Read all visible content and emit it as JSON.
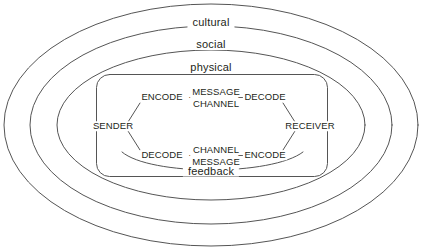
{
  "diagram": {
    "colors": {
      "stroke": "#555555",
      "text": "#231f20",
      "background": "#ffffff"
    },
    "environments": [
      {
        "name": "cultural",
        "label": "cultural"
      },
      {
        "name": "social",
        "label": "social"
      },
      {
        "name": "physical",
        "label": "physical"
      }
    ],
    "participants": {
      "sender": "SENDER",
      "receiver": "RECEIVER"
    },
    "top_path": {
      "encode": "ENCODE",
      "channel_stack": {
        "line1": "MESSAGE",
        "line2": "CHANNEL"
      },
      "decode": "DECODE",
      "connector": "–"
    },
    "bottom_path": {
      "decode": "DECODE",
      "channel_stack": {
        "line1": "CHANNEL",
        "line2": "MESSAGE"
      },
      "encode": "ENCODE",
      "connector": "–"
    },
    "feedback": {
      "label": "feedback"
    }
  }
}
